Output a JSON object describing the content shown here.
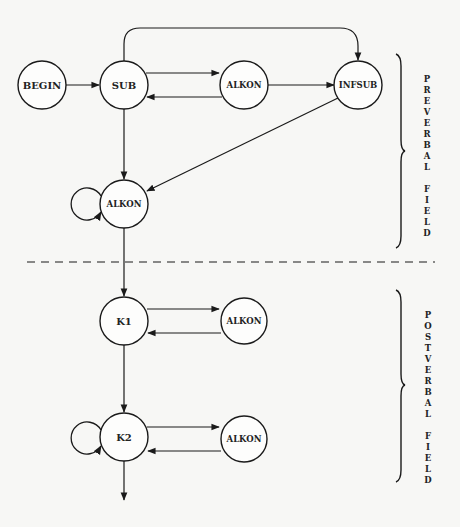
{
  "diagram": {
    "nodes": [
      {
        "id": "begin",
        "label": "BEGIN"
      },
      {
        "id": "sub",
        "label": "SUB"
      },
      {
        "id": "alkon_pre1",
        "label": "ALKON"
      },
      {
        "id": "infsub",
        "label": "INFSUB"
      },
      {
        "id": "alkon_pre2",
        "label": "ALKON"
      },
      {
        "id": "k1",
        "label": "K1"
      },
      {
        "id": "alkon_k1",
        "label": "ALKON"
      },
      {
        "id": "k2",
        "label": "K2"
      },
      {
        "id": "alkon_k2",
        "label": "ALKON"
      }
    ],
    "edges": [
      {
        "from": "BEGIN",
        "to": "SUB"
      },
      {
        "from": "SUB",
        "to": "ALKON"
      },
      {
        "from": "ALKON",
        "to": "SUB"
      },
      {
        "from": "ALKON",
        "to": "INFSUB"
      },
      {
        "from": "SUB",
        "to": "INFSUB",
        "style": "arc-over"
      },
      {
        "from": "SUB",
        "to": "ALKON (preverbal)"
      },
      {
        "from": "INFSUB",
        "to": "ALKON (preverbal)"
      },
      {
        "from": "ALKON (preverbal)",
        "to": "ALKON (preverbal)",
        "style": "self-loop"
      },
      {
        "from": "ALKON (preverbal)",
        "to": "K1"
      },
      {
        "from": "K1",
        "to": "ALKON"
      },
      {
        "from": "ALKON",
        "to": "K1"
      },
      {
        "from": "K1",
        "to": "K2"
      },
      {
        "from": "K2",
        "to": "K2",
        "style": "self-loop"
      },
      {
        "from": "K2",
        "to": "ALKON"
      },
      {
        "from": "ALKON",
        "to": "K2"
      },
      {
        "from": "K2",
        "to": "exit"
      }
    ],
    "fields": {
      "preverbal": {
        "label": "PREVERBAL FIELD",
        "letters": [
          "P",
          "R",
          "E",
          "V",
          "E",
          "R",
          "B",
          "A",
          "L",
          "",
          "F",
          "I",
          "E",
          "L",
          "D"
        ]
      },
      "postverbal": {
        "label": "POSTVERBAL FIELD",
        "letters": [
          "P",
          "O",
          "S",
          "T",
          "V",
          "E",
          "R",
          "B",
          "A",
          "L",
          "",
          "F",
          "I",
          "E",
          "L",
          "D"
        ]
      }
    }
  }
}
